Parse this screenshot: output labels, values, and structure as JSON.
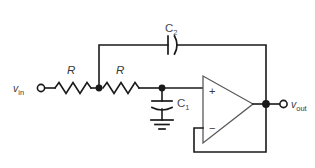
{
  "diagram": {
    "background_color": "#ffffff",
    "wire_color": "#1a1a1a",
    "label_color": "#3a3a3a",
    "width": 315,
    "height": 168
  },
  "terminals": {
    "input": {
      "label_v": "v",
      "label_sub": "in",
      "symbol": "open-circle-terminal"
    },
    "output": {
      "label_v": "v",
      "label_sub": "out",
      "symbol": "open-circle-terminal"
    }
  },
  "components": {
    "resistor1": {
      "label": "R",
      "symbol": "zigzag-resistor"
    },
    "resistor2": {
      "label": "R",
      "symbol": "zigzag-resistor"
    },
    "capacitor1": {
      "label_c": "C",
      "label_sub": "1",
      "symbol": "curved-plate-capacitor",
      "orientation": "vertical"
    },
    "capacitor2": {
      "label_c": "C",
      "label_sub": "2",
      "symbol": "curved-plate-capacitor",
      "orientation": "horizontal"
    },
    "opamp": {
      "symbol": "triangle-opamp",
      "noninverting_sign": "+",
      "inverting_sign": "−",
      "configuration": "unity-gain-buffer"
    },
    "ground": {
      "symbol": "earth-ground",
      "bars": 3
    }
  },
  "nodes": {
    "node1_label": "R-R junction",
    "node2_label": "opamp-input node",
    "node3_label": "output node"
  }
}
